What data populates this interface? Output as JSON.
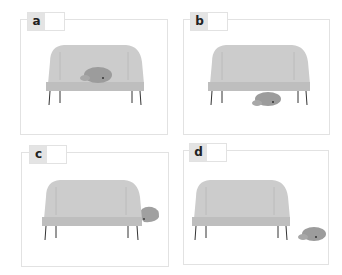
{
  "panels": [
    {
      "label": "a",
      "cat_position": "on sofa"
    },
    {
      "label": "b",
      "cat_position": "under sofa"
    },
    {
      "label": "c",
      "cat_position": "beside sofa (behind right arm)"
    },
    {
      "label": "d",
      "cat_position": "next to sofa on floor"
    }
  ],
  "colors": {
    "sofa": "#c9c9c9",
    "sofa_seat": "#bdbdbd",
    "cat": "#9a9a9a",
    "frame": "#e2e2e2",
    "label_bg": "#e4e4e4"
  }
}
